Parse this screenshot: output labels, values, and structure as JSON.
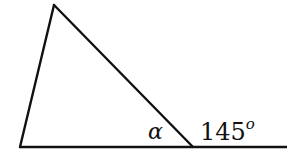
{
  "diagram": {
    "type": "triangle-exterior-angle",
    "colors": {
      "stroke": "#111111",
      "background": "#ffffff"
    },
    "vertices": {
      "top": {
        "x": 54,
        "y": 5
      },
      "bottom_left": {
        "x": 20,
        "y": 147
      },
      "bottom_right": {
        "x": 193,
        "y": 147
      }
    },
    "baseline_end": {
      "x": 287,
      "y": 147
    },
    "labels": {
      "interior_angle": "α",
      "exterior_angle_value": "145",
      "exterior_angle_unit": "o"
    }
  }
}
